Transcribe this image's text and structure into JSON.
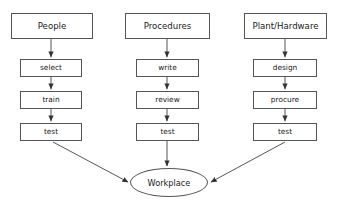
{
  "diagram": {
    "type": "flowchart",
    "title_visible": false,
    "background_color": "#ffffff",
    "stroke_color": "#555555",
    "text_color": "#1a1a1a",
    "columns": [
      {
        "id": "people",
        "header": {
          "label": "People",
          "x": 11,
          "y": 13,
          "w": 82,
          "h": 26
        },
        "steps": [
          {
            "label": "select",
            "x": 20,
            "y": 59,
            "w": 62,
            "h": 18
          },
          {
            "label": "train",
            "x": 20,
            "y": 91,
            "w": 62,
            "h": 18
          },
          {
            "label": "test",
            "x": 20,
            "y": 123,
            "w": 62,
            "h": 18
          }
        ]
      },
      {
        "id": "procedures",
        "header": {
          "label": "Procedures",
          "x": 125,
          "y": 13,
          "w": 85,
          "h": 26
        },
        "steps": [
          {
            "label": "write",
            "x": 136,
            "y": 59,
            "w": 63,
            "h": 18
          },
          {
            "label": "review",
            "x": 136,
            "y": 91,
            "w": 63,
            "h": 18
          },
          {
            "label": "test",
            "x": 136,
            "y": 123,
            "w": 63,
            "h": 18
          }
        ]
      },
      {
        "id": "plant-hardware",
        "header": {
          "label": "Plant/Hardware",
          "x": 244,
          "y": 13,
          "w": 83,
          "h": 26
        },
        "steps": [
          {
            "label": "design",
            "x": 253,
            "y": 59,
            "w": 64,
            "h": 18
          },
          {
            "label": "procure",
            "x": 253,
            "y": 91,
            "w": 64,
            "h": 18
          },
          {
            "label": "test",
            "x": 253,
            "y": 123,
            "w": 64,
            "h": 18
          }
        ]
      }
    ],
    "sink": {
      "id": "workplace",
      "label": "Workplace",
      "shape": "ellipse",
      "x": 130,
      "y": 168,
      "w": 78,
      "h": 29
    },
    "connections": [
      {
        "from": "People",
        "to": "select",
        "kind": "vertical-arrow"
      },
      {
        "from": "select",
        "to": "train",
        "kind": "vertical-arrow"
      },
      {
        "from": "train",
        "to": "test",
        "kind": "vertical-arrow"
      },
      {
        "from": "Procedures",
        "to": "write",
        "kind": "vertical-arrow"
      },
      {
        "from": "write",
        "to": "review",
        "kind": "vertical-arrow"
      },
      {
        "from": "review",
        "to": "test",
        "kind": "vertical-arrow"
      },
      {
        "from": "Plant/Hardware",
        "to": "design",
        "kind": "vertical-arrow"
      },
      {
        "from": "design",
        "to": "procure",
        "kind": "vertical-arrow"
      },
      {
        "from": "procure",
        "to": "test",
        "kind": "vertical-arrow"
      },
      {
        "from": "test (People)",
        "to": "Workplace",
        "kind": "diagonal-arrow"
      },
      {
        "from": "test (Procedures)",
        "to": "Workplace",
        "kind": "vertical-arrow"
      },
      {
        "from": "test (Plant/Hardware)",
        "to": "Workplace",
        "kind": "diagonal-arrow"
      }
    ]
  }
}
